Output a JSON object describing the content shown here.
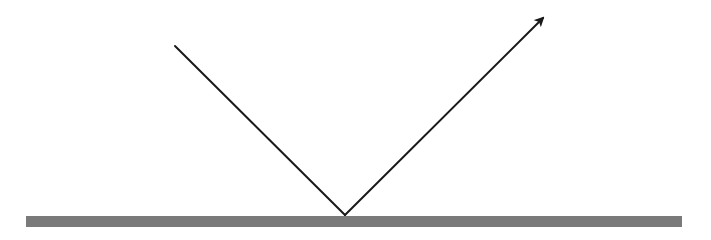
{
  "diagram": {
    "colors": {
      "background": "#ffffff",
      "ray": "#1a1a1a",
      "surface": "#7a7a7a"
    },
    "surface": {
      "x1": 26,
      "x2": 682,
      "y": 216,
      "height": 11
    },
    "incident_ray": {
      "x1": 175,
      "y1": 46,
      "x2": 345,
      "y2": 215
    },
    "reflected_ray": {
      "x1": 345,
      "y1": 215,
      "x2": 543,
      "y2": 18,
      "arrowhead": true
    }
  }
}
